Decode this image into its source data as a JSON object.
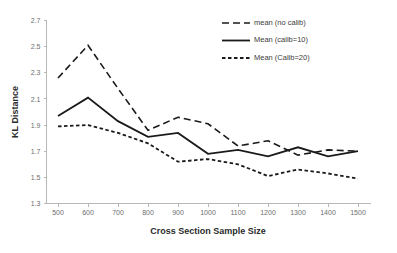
{
  "chart_data": {
    "type": "line",
    "title": "",
    "xlabel": "Cross Section Sample Size",
    "ylabel": "KL Distance",
    "categories": [
      500,
      600,
      700,
      800,
      900,
      1000,
      1100,
      1200,
      1300,
      1400,
      1500
    ],
    "x_tick_labels": [
      "500",
      "600",
      "700",
      "800",
      "900",
      "1000",
      "1100",
      "1200",
      "1300",
      "1400",
      "1500"
    ],
    "y_tick_labels": [
      "1.3",
      "1.5",
      "1.7",
      "1.9",
      "2.1",
      "2.3",
      "2.5",
      "2.7"
    ],
    "y_ticks": [
      1.3,
      1.5,
      1.7,
      1.9,
      2.1,
      2.3,
      2.5,
      2.7
    ],
    "ylim": [
      1.3,
      2.7
    ],
    "grid": false,
    "legend_position": "top-right",
    "series": [
      {
        "name": "mean (no calib)",
        "dash": "long-dash",
        "stroke_width": 1.6,
        "values": [
          2.26,
          2.51,
          2.18,
          1.86,
          1.96,
          1.91,
          1.74,
          1.78,
          1.67,
          1.71,
          1.7
        ]
      },
      {
        "name": "Mean (calib=10)",
        "dash": "solid",
        "stroke_width": 1.8,
        "values": [
          1.97,
          2.11,
          1.93,
          1.81,
          1.84,
          1.68,
          1.71,
          1.66,
          1.73,
          1.66,
          1.7
        ]
      },
      {
        "name": "Mean (Calib=20)",
        "dash": "short-dash",
        "stroke_width": 1.8,
        "values": [
          1.89,
          1.9,
          1.84,
          1.76,
          1.62,
          1.64,
          1.6,
          1.51,
          1.56,
          1.53,
          1.49
        ]
      }
    ],
    "colors": {
      "series_stroke": "#1a1a1a",
      "axis": "#b8b8b8",
      "tick_text": "#6e6e6e",
      "title_text": "#2b2b2b",
      "background": "#ffffff"
    }
  }
}
